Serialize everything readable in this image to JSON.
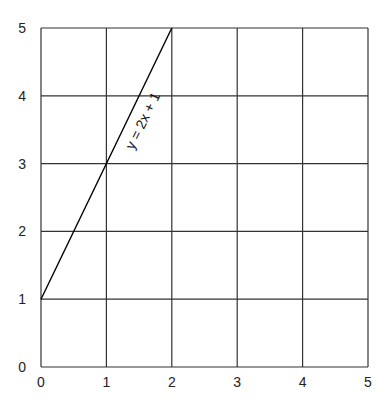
{
  "chart_data": {
    "type": "line",
    "title": "",
    "xlabel": "",
    "ylabel": "",
    "xlim": [
      0,
      5
    ],
    "ylim": [
      0,
      5
    ],
    "grid": true,
    "x_ticks": [
      "0",
      "1",
      "2",
      "3",
      "4",
      "5"
    ],
    "y_ticks": [
      "0",
      "1",
      "2",
      "3",
      "4",
      "5"
    ],
    "series": [
      {
        "name": "y = 2x + 1",
        "x": [
          0,
          2
        ],
        "y": [
          1,
          5
        ],
        "color": "#000000"
      }
    ],
    "annotations": [
      {
        "text": "y = 2x + 1",
        "x": 1.5,
        "y": 3.6,
        "rotation": -64
      }
    ],
    "gridlines_y": [
      1,
      2,
      3,
      4
    ]
  }
}
